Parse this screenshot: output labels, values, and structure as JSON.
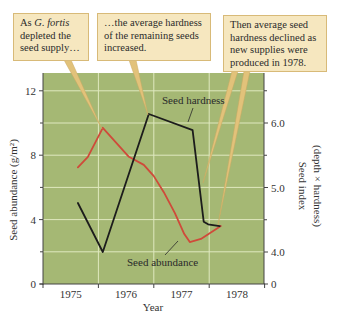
{
  "callouts": [
    {
      "prefix": "As ",
      "italic": "G. fortis",
      "suffix": " depleted the seed supply…"
    },
    {
      "text": "…the average hardness of the remaining seeds increased."
    },
    {
      "text": "Then average seed hardness declined as new supplies were produced in 1978."
    }
  ],
  "axes": {
    "left_title": "Seed abundance (g/m²)",
    "right_title_1": "Seed index",
    "right_title_2": "(depth × hardness)",
    "x_title": "Year"
  },
  "series_labels": {
    "hardness": "Seed hardness",
    "abundance": "Seed abundance"
  },
  "colors": {
    "plot_bg": "#a5b874",
    "grid": "#dfe8bf",
    "abundance": "#cf4a3a",
    "hardness": "#1c1c1c",
    "callout_bg": "#f6e7bf",
    "callout_border": "#d8ba78",
    "leader": "#e2c27a"
  },
  "chart_data": {
    "type": "line",
    "title": "",
    "xlabel": "Year",
    "ylabel": "Seed abundance (g/m²)",
    "ylabel_right": "Seed index (depth × hardness)",
    "x_ticks": [
      "1975",
      "1976",
      "1977",
      "1978"
    ],
    "x_range": [
      1975.0,
      1979.0
    ],
    "left_ylim": [
      0,
      13
    ],
    "left_yticks": [
      0,
      4,
      8,
      12
    ],
    "right_yticks": [
      "0",
      "4.0",
      "5.0",
      "6.0"
    ],
    "right_axis_broken_between": [
      0,
      4.0
    ],
    "grid": true,
    "series": [
      {
        "name": "Seed abundance",
        "axis": "left",
        "color": "#cf4a3a",
        "x": [
          1975.63,
          1975.81,
          1976.08,
          1976.55,
          1976.82,
          1977.0,
          1977.18,
          1977.38,
          1977.55,
          1977.65,
          1977.85,
          1978.21
        ],
        "values": [
          7.25,
          7.9,
          9.7,
          7.9,
          7.4,
          6.7,
          5.7,
          4.4,
          3.1,
          2.6,
          2.8,
          3.6
        ]
      },
      {
        "name": "Seed hardness",
        "axis": "right",
        "color": "#1c1c1c",
        "x": [
          1975.63,
          1976.08,
          1976.91,
          1977.7,
          1977.9,
          1977.98,
          1978.19
        ],
        "values": [
          4.76,
          4.0,
          6.14,
          5.89,
          4.47,
          4.43,
          4.4
        ]
      }
    ],
    "annotations": [
      "As G. fortis depleted the seed supply…",
      "…the average hardness of the remaining seeds increased.",
      "Then average seed hardness declined as new supplies were produced in 1978."
    ]
  }
}
